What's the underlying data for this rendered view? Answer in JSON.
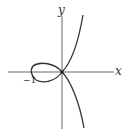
{
  "diagram": {
    "type": "curve-plot",
    "x_axis_label": "x",
    "y_axis_label": "y",
    "tick_labels": [
      "−1"
    ],
    "curve_color": "#333333",
    "axis_color": "#555555"
  }
}
